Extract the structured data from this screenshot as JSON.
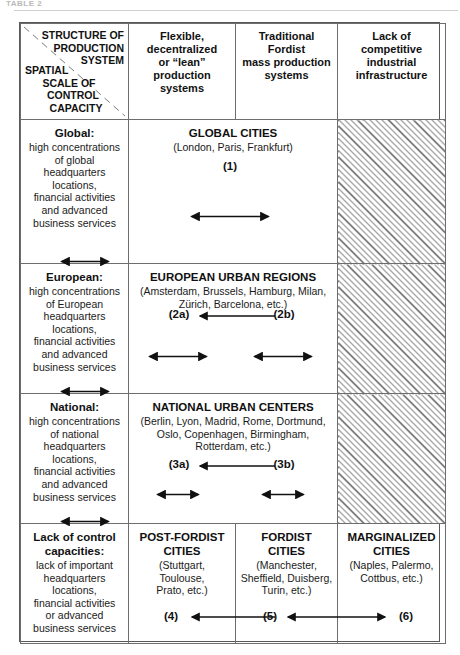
{
  "page": {
    "top_fragment": "TABLE 2"
  },
  "header": {
    "corner": {
      "top_lines": [
        "STRUCTURE OF",
        "PRODUCTION",
        "SYSTEM"
      ],
      "bottom_lines": [
        "SPATIAL",
        "SCALE OF",
        "CONTROL",
        "CAPACITY"
      ]
    },
    "columns": [
      {
        "lines": [
          "Flexible,",
          "decentralized",
          "or “lean”",
          "production",
          "systems"
        ]
      },
      {
        "lines": [
          "Traditional",
          "Fordist",
          "mass production",
          "systems"
        ]
      },
      {
        "lines": [
          "Lack of",
          "competitive",
          "industrial",
          "infrastructure"
        ]
      }
    ]
  },
  "rows": [
    {
      "scale": {
        "title": "Global:",
        "body_lines": [
          "high concentrations",
          "of global",
          "headquarters",
          "locations,",
          "financial activities",
          "and advanced",
          "business services"
        ]
      },
      "content": {
        "title": "GLOBAL CITIES",
        "subtitle_lines": [
          "(London, Paris, Frankfurt)"
        ]
      },
      "hatched": true
    },
    {
      "scale": {
        "title": "European:",
        "body_lines": [
          "high concentrations",
          "of European",
          "headquarters",
          "locations,",
          "financial activities",
          "and advanced",
          "business services"
        ]
      },
      "content": {
        "title": "EUROPEAN URBAN REGIONS",
        "subtitle_lines": [
          "(Amsterdam, Brussels, Hamburg, Milan,",
          "Zürich, Barcelona, etc.)"
        ]
      },
      "hatched": true
    },
    {
      "scale": {
        "title": "National:",
        "body_lines": [
          "high concentrations",
          "of national",
          "headquarters",
          "locations,",
          "financial activities",
          "and advanced",
          "business services"
        ]
      },
      "content": {
        "title": "NATIONAL URBAN CENTERS",
        "subtitle_lines": [
          "(Berlin, Lyon, Madrid, Rome, Dortmund,",
          "Oslo, Copenhagen, Birmingham,",
          "Rotterdam, etc.)"
        ]
      },
      "hatched": true
    }
  ],
  "bottom_row": {
    "scale": {
      "title_lines": [
        "Lack of control",
        "capacities:"
      ],
      "body_lines": [
        "lack of important",
        "headquarters",
        "locations,",
        "financial activities",
        "or advanced",
        "business services"
      ]
    },
    "cells": [
      {
        "title_lines": [
          "POST-FORDIST",
          "CITIES"
        ],
        "subtitle_lines": [
          "(Stuttgart,",
          "Toulouse,",
          "Prato, etc.)"
        ]
      },
      {
        "title_lines": [
          "FORDIST",
          "CITIES"
        ],
        "subtitle_lines": [
          "(Manchester,",
          "Sheffield, Duisberg,",
          "Turin, etc.)"
        ]
      },
      {
        "title_lines": [
          "MARGINALIZED",
          "CITIES"
        ],
        "subtitle_lines": [
          "(Naples, Palermo,",
          "Cottbus, etc.)"
        ]
      }
    ]
  },
  "arrow_labels": {
    "n1": "(1)",
    "n2a": "(2a)",
    "n2b": "(2b)",
    "n3a": "(3a)",
    "n3b": "(3b)",
    "n4": "(4)",
    "n5": "(5)",
    "n6": "(6)"
  },
  "colors": {
    "border": "#6d6d6d",
    "outer_border": "#585858",
    "text": "#111111",
    "hatch": "#555555"
  }
}
